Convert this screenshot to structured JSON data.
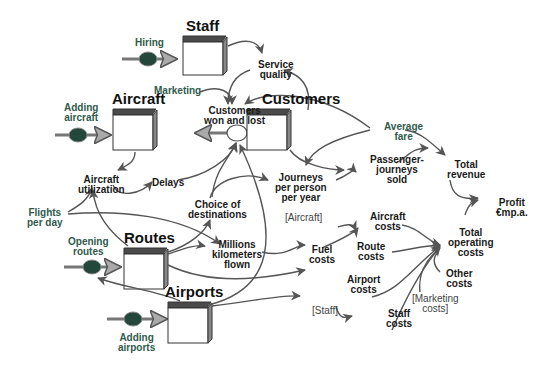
{
  "diagram": {
    "stocks": {
      "staff": "Staff",
      "aircraft": "Aircraft",
      "customers": "Customers",
      "routes": "Routes",
      "airports": "Airports"
    },
    "flows": {
      "hiring": "Hiring",
      "adding_aircraft": "Adding\naircraft",
      "customers_won_lost": "Customers\nwon and lost",
      "opening_routes": "Opening\nroutes",
      "adding_airports": "Adding\nairports"
    },
    "variables": {
      "service_quality": "Service\nquality",
      "marketing": "Marketing",
      "average_fare": "Average\nfare",
      "aircraft_utilization": "Aircraft\nutilization",
      "delays": "Delays",
      "flights_per_day": "Flights\nper day",
      "choice_of_destinations": "Choice of\ndestinations",
      "journeys_per_person": "Journeys\nper person\nper year",
      "passenger_journeys_sold": "Passenger-\njourneys\nsold",
      "total_revenue": "Total\nrevenue",
      "profit": "Profit\n€mp.a.",
      "millions_km_flown": "Millions\nkilometers\nflown",
      "aircraft_ref": "[Aircraft]",
      "aircraft_costs": "Aircraft\ncosts",
      "fuel_costs": "Fuel\ncosts",
      "route_costs": "Route\ncosts",
      "airport_costs": "Airport\ncosts",
      "total_operating_costs": "Total\noperating\ncosts",
      "other_costs": "Other\ncosts",
      "marketing_costs_ref": "[Marketing\ncosts]",
      "staff_ref": "[Staff]",
      "staff_costs": "Staff\ncosts"
    },
    "colors": {
      "arrow": "#555555",
      "valve": "#24473c",
      "green_label": "#2f5a4c",
      "stock_top": "#4a4a4a"
    }
  }
}
